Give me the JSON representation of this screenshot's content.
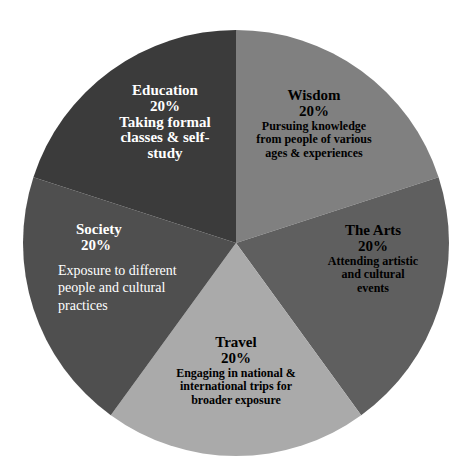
{
  "chart_data": {
    "type": "pie",
    "title": "",
    "categories": [
      "Wisdom",
      "The Arts",
      "Travel",
      "Society",
      "Education"
    ],
    "values": [
      20,
      20,
      20,
      20,
      20
    ],
    "unit": "%",
    "descriptions": {
      "Wisdom": "Pursuing knowledge from people of various ages & experiences",
      "The Arts": "Attending artistic and cultural events",
      "Travel": "Engaging in national & international trips for broader exposure",
      "Society": "Exposure to different people and cultural practices",
      "Education": "Taking formal classes & self-study"
    },
    "colors": {
      "Wisdom": "#808080",
      "The Arts": "#5e5e5e",
      "Travel": "#aaaaaa",
      "Society": "#505050",
      "Education": "#3b3b3b"
    },
    "start_angle_deg": 0,
    "direction": "clockwise",
    "legend": "none",
    "labels_inside": true
  },
  "slices": [
    {
      "name": "Education",
      "percent": "20%",
      "lines": [
        "Taking formal",
        "classes & self-",
        "study"
      ],
      "color": "#3b3b3b",
      "text_color": "#ffffff"
    },
    {
      "name": "Wisdom",
      "percent": "20%",
      "lines": [
        "Pursuing knowledge",
        "from people of various",
        "ages & experiences"
      ],
      "color": "#808080",
      "text_color": "#000000"
    },
    {
      "name": "The Arts",
      "percent": "20%",
      "lines": [
        "Attending artistic",
        "and cultural",
        "events"
      ],
      "color": "#5e5e5e",
      "text_color": "#000000"
    },
    {
      "name": "Travel",
      "percent": "20%",
      "lines": [
        "Engaging in national &",
        "international trips for",
        "broader exposure"
      ],
      "color": "#aaaaaa",
      "text_color": "#000000"
    },
    {
      "name": "Society",
      "percent": "20%",
      "lines": [
        "Exposure to different",
        "people and cultural",
        "practices"
      ],
      "color": "#505050",
      "text_color": "#ffffff"
    }
  ]
}
